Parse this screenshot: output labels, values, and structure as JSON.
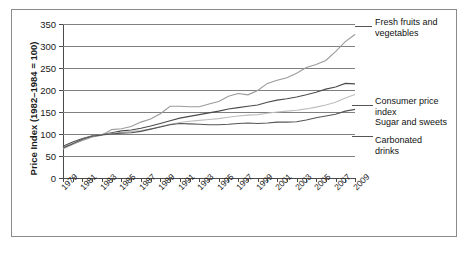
{
  "chart_data": {
    "type": "line",
    "title": "",
    "xlabel": "",
    "ylabel": "Price Index (1982–1984 = 100)",
    "ylim": [
      0,
      350
    ],
    "yticks": [
      0,
      50,
      100,
      150,
      200,
      250,
      300,
      350
    ],
    "xlim": [
      1979,
      2009
    ],
    "grid": true,
    "legend_position": "right-inline-labels",
    "x": [
      1979,
      1980,
      1981,
      1982,
      1983,
      1984,
      1985,
      1986,
      1987,
      1988,
      1989,
      1990,
      1991,
      1992,
      1993,
      1994,
      1995,
      1996,
      1997,
      1998,
      1999,
      2000,
      2001,
      2002,
      2003,
      2004,
      2005,
      2006,
      2007,
      2008,
      2009
    ],
    "tick_labels": [
      "1979",
      "1981",
      "1983",
      "1985",
      "1987",
      "1989",
      "1991",
      "1993",
      "1995",
      "1997",
      "1999",
      "2001",
      "2003",
      "2005",
      "2007",
      "2009"
    ],
    "series": [
      {
        "name": "Fresh fruits and vegetables",
        "color": "#9a9a9a",
        "values": [
          69,
          77,
          85,
          93,
          97,
          110,
          112,
          117,
          127,
          134,
          146,
          163,
          163,
          162,
          162,
          168,
          174,
          186,
          192,
          189,
          199,
          215,
          222,
          228,
          238,
          251,
          258,
          267,
          287,
          310,
          326
        ]
      },
      {
        "name": "Consumer price index",
        "color": "#4b4b4b",
        "values": [
          72,
          82,
          90,
          96,
          99,
          103,
          107,
          109,
          113,
          118,
          124,
          130,
          136,
          140,
          144,
          148,
          152,
          157,
          160,
          163,
          166,
          172,
          177,
          180,
          184,
          189,
          195,
          202,
          207,
          215,
          214
        ]
      },
      {
        "name": "Sugar and sweets",
        "color": "#bdbdbd",
        "values": [
          66,
          76,
          88,
          95,
          99,
          101,
          104,
          106,
          108,
          111,
          117,
          122,
          126,
          129,
          131,
          133,
          135,
          138,
          141,
          143,
          144,
          147,
          150,
          152,
          154,
          157,
          161,
          166,
          172,
          182,
          190
        ]
      },
      {
        "name": "Carbonated drinks",
        "color": "#555555",
        "values": [
          68,
          78,
          88,
          95,
          98,
          100,
          102,
          103,
          106,
          111,
          116,
          121,
          124,
          123,
          122,
          121,
          121,
          122,
          124,
          125,
          124,
          125,
          127,
          127,
          128,
          132,
          137,
          141,
          145,
          152,
          156
        ]
      }
    ],
    "annotations": [
      {
        "label_line1": "Fresh fruits and",
        "label_line2": "vegetables"
      },
      {
        "label_line1": "Consumer price",
        "label_line2": "index"
      },
      {
        "label_line1": "Sugar and sweets",
        "label_line2": ""
      },
      {
        "label_line1": "Carbonated",
        "label_line2": "drinks"
      }
    ]
  }
}
